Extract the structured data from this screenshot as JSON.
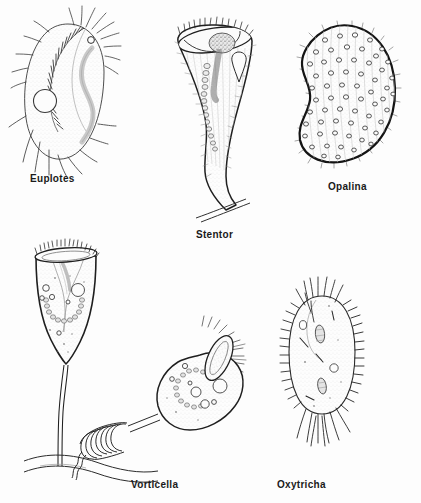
{
  "figure": {
    "kind": "scientific-illustration",
    "background_color": "#fdfdfd",
    "ink_color": "#1a1a1a",
    "fill_color": "#fbfbfb",
    "stipple_color": "#9a9a9a"
  },
  "organisms": [
    {
      "id": "euplotes",
      "label": "Euplotes",
      "label_x": 30,
      "label_y": 173,
      "shape": "oval-flattened-body-with-cirri",
      "features": [
        "adoral-zone-of-membranelles",
        "contractile-vacuole",
        "curved-macronucleus",
        "caudal-cirri",
        "frontal-cirri"
      ]
    },
    {
      "id": "stentor",
      "label": "Stentor",
      "label_x": 196,
      "label_y": 229,
      "shape": "trumpet-shaped-attached",
      "features": [
        "peristome-rim",
        "oral-groove",
        "contractile-vacuole",
        "beaded-moniliform-macronucleus",
        "holdfast",
        "substrate-line"
      ]
    },
    {
      "id": "opalina",
      "label": "Opalina",
      "label_x": 328,
      "label_y": 181,
      "shape": "flattened-kidney-bean-body",
      "features": [
        "multinucleate",
        "uniform-cilia-rows",
        "thick-pellicle-outline"
      ]
    },
    {
      "id": "vorticella-extended",
      "label": "Vorticella",
      "label_x": 131,
      "label_y": 479,
      "shape": "bell-on-long-stalk",
      "features": [
        "ciliated-peristome",
        "inner-vestibulum",
        "c-shaped-macronucleus",
        "food-vacuoles",
        "contractile-vacuole",
        "extended-stalk",
        "substrate-line"
      ]
    },
    {
      "id": "vorticella-contracted",
      "label": "",
      "shape": "bell-on-coiled-stalk",
      "features": [
        "open-peristome-with-cilia",
        "c-shaped-macronucleus",
        "food-vacuoles",
        "contracted-helical-stalk"
      ]
    },
    {
      "id": "oxytricha",
      "label": "Oxytricha",
      "label_x": 277,
      "label_y": 479,
      "shape": "elongate-oval-body",
      "features": [
        "marginal-cirri",
        "frontal-cirri",
        "two-oval-macronuclei",
        "contractile-vacuole",
        "caudal-cirri"
      ]
    }
  ]
}
